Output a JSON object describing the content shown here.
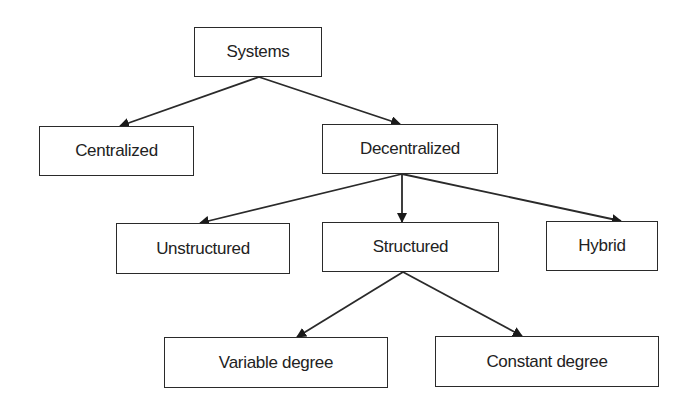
{
  "diagram": {
    "type": "tree",
    "colors": {
      "stroke": "#2a2a2a",
      "text": "#222222",
      "background": "#ffffff"
    },
    "nodes": {
      "systems": {
        "label": "Systems",
        "x": 194,
        "y": 27,
        "w": 128,
        "h": 50
      },
      "centralized": {
        "label": "Centralized",
        "x": 39,
        "y": 126,
        "w": 155,
        "h": 50
      },
      "decentralized": {
        "label": "Decentralized",
        "x": 322,
        "y": 124,
        "w": 176,
        "h": 50
      },
      "unstructured": {
        "label": "Unstructured",
        "x": 116,
        "y": 223,
        "w": 174,
        "h": 51
      },
      "structured": {
        "label": "Structured",
        "x": 322,
        "y": 222,
        "w": 177,
        "h": 50
      },
      "hybrid": {
        "label": "Hybrid",
        "x": 546,
        "y": 221,
        "w": 112,
        "h": 50
      },
      "variable_degree": {
        "label": "Variable degree",
        "x": 164,
        "y": 337,
        "w": 224,
        "h": 51
      },
      "constant_degree": {
        "label": "Constant degree",
        "x": 435,
        "y": 336,
        "w": 224,
        "h": 51
      }
    },
    "edges": [
      {
        "from": "systems",
        "to": "centralized",
        "x1": 259,
        "y1": 77,
        "x2": 120,
        "y2": 126
      },
      {
        "from": "systems",
        "to": "decentralized",
        "x1": 259,
        "y1": 77,
        "x2": 400,
        "y2": 124
      },
      {
        "from": "decentralized",
        "to": "unstructured",
        "x1": 402,
        "y1": 174,
        "x2": 200,
        "y2": 223
      },
      {
        "from": "decentralized",
        "to": "structured",
        "x1": 402,
        "y1": 174,
        "x2": 402,
        "y2": 222
      },
      {
        "from": "decentralized",
        "to": "hybrid",
        "x1": 402,
        "y1": 174,
        "x2": 621,
        "y2": 221
      },
      {
        "from": "structured",
        "to": "variable_degree",
        "x1": 403,
        "y1": 272,
        "x2": 297,
        "y2": 337
      },
      {
        "from": "structured",
        "to": "constant_degree",
        "x1": 403,
        "y1": 272,
        "x2": 522,
        "y2": 336
      }
    ]
  }
}
